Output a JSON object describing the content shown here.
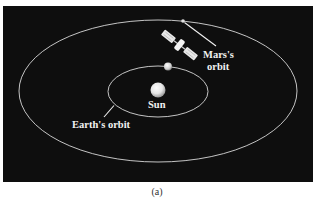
{
  "figure": {
    "caption": "(a)",
    "background_color": "#0e0e0e",
    "orbit_color": "#d8d8d8"
  },
  "bodies": {
    "sun": {
      "label": "Sun"
    },
    "earth": {
      "label": ""
    },
    "mars": {
      "label": ""
    },
    "spacecraft": {
      "label": ""
    }
  },
  "orbits": {
    "earth": {
      "label": "Earth's orbit"
    },
    "mars": {
      "label_line1": "Mars's",
      "label_line2": "orbit"
    }
  }
}
